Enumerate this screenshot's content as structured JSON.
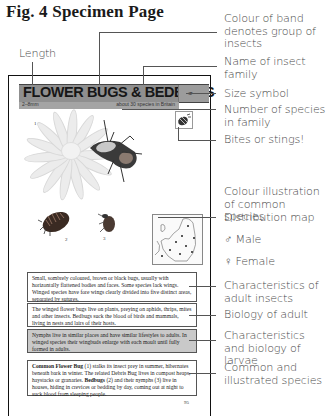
{
  "figure": {
    "title": "Fig. 4  Specimen Page"
  },
  "specimen_page": {
    "band_title": "FLOWER BUGS & BEDBUGS",
    "length": "2–8mm",
    "species_count": "about 30 species in Britain",
    "size_symbol": "size-symbol-icon",
    "bite_symbol": "bite-sting-icon",
    "illustration_numbers": [
      "1",
      "2",
      "3"
    ],
    "text_boxes": [
      {
        "id": "adult-characteristics",
        "text": "Small, sombrely coloured, brown or black bugs, usually with horizontally flattened bodies and faces. Some species lack wings. Winged species have fore wings clearly divided into five distinct areas, separated by sutures."
      },
      {
        "id": "adult-biology",
        "text": "The winged flower bugs live on plants, preying on aphids, thrips, mites and other insects. Bedbugs suck the blood of birds and mammals, living in nests and lairs of their hosts."
      },
      {
        "id": "larvae",
        "text": "Nymphs live in similar places and have similar lifestyles to adults. In winged species their wingbuds enlarge with each moult until fully formed in adults."
      },
      {
        "id": "species",
        "bold1": "Common Flower Bug",
        "part1": " (1) stalks its insect prey in summer, hibernates beneath bark in winter. The related Debris Bug lives in compost heaps, haystacks or granaries. ",
        "bold2": "Bedbugs",
        "part2": " (2) and their nymphs (3) live in houses, hiding in crevices or bedding by day, coming out at night to suck blood from sleeping people."
      }
    ],
    "page_number": "95"
  },
  "annotations": {
    "length": "Length",
    "band_colour": "Colour of band denotes group of insects",
    "family_name": "Name of insect family",
    "size_symbol": "Size symbol",
    "species_number": "Number of species in family",
    "bites": "Bites or stings!",
    "colour_illustration": "Colour illustration of common species",
    "distribution_map": "Distribution map",
    "male_symbol": "♂",
    "male": "Male",
    "female_symbol": "♀",
    "female": "Female",
    "adult_characteristics": "Characteristics of adult insects",
    "adult_biology": "Biology of adult",
    "larvae": "Characteristics and biology of larvae",
    "species": "Common and illustrated species"
  },
  "colors": {
    "band": "#8f8f8f",
    "larvae_box": "#c9c9c9",
    "annotation_text": "#4a4a4a"
  }
}
